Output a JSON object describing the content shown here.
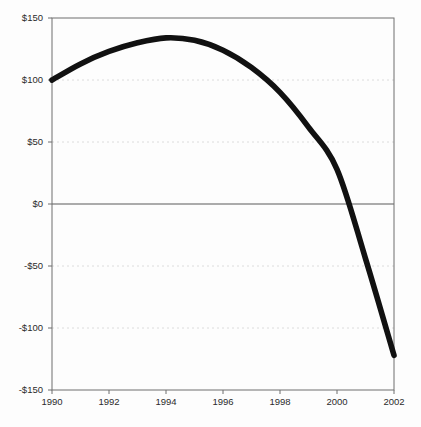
{
  "chart_data": {
    "type": "line",
    "title": "",
    "subtitle": "",
    "xlabel": "",
    "ylabel": "",
    "xlim": [
      1990,
      2002
    ],
    "ylim": [
      -150,
      150
    ],
    "grid": true,
    "legend": null,
    "legend_position": "none",
    "zero_line": 0,
    "currency_prefix": "$",
    "x_tick_labels": [
      "1990",
      "1992",
      "1994",
      "1996",
      "1998",
      "2000",
      "2002"
    ],
    "x_ticks": [
      1990,
      1992,
      1994,
      1996,
      1998,
      2000,
      2002
    ],
    "y_tick_labels": [
      "$150",
      "$100",
      "$50",
      "$0",
      "-$50",
      "-$100",
      "-$150"
    ],
    "y_ticks": [
      150,
      100,
      50,
      0,
      -50,
      -100,
      -150
    ],
    "x": [
      1990,
      1991,
      1992,
      1993,
      1994,
      1995,
      1996,
      1997,
      1998,
      1999,
      2000,
      2001,
      2002
    ],
    "values": [
      100,
      113,
      123,
      130,
      134,
      132,
      124,
      110,
      90,
      62,
      28,
      -44,
      -122
    ],
    "series": [
      {
        "name": "value",
        "color": "#111111",
        "values": [
          100,
          113,
          123,
          130,
          134,
          132,
          124,
          110,
          90,
          62,
          28,
          -44,
          -122
        ]
      }
    ],
    "annotations": []
  },
  "style": {
    "line_color": "#111111",
    "grid_color": "#d8d8d8",
    "axis_color": "#6f6f6f",
    "zero_line_color": "#5a5a5a",
    "background": "#fdfdfd",
    "text_color": "#2b2b2b"
  }
}
